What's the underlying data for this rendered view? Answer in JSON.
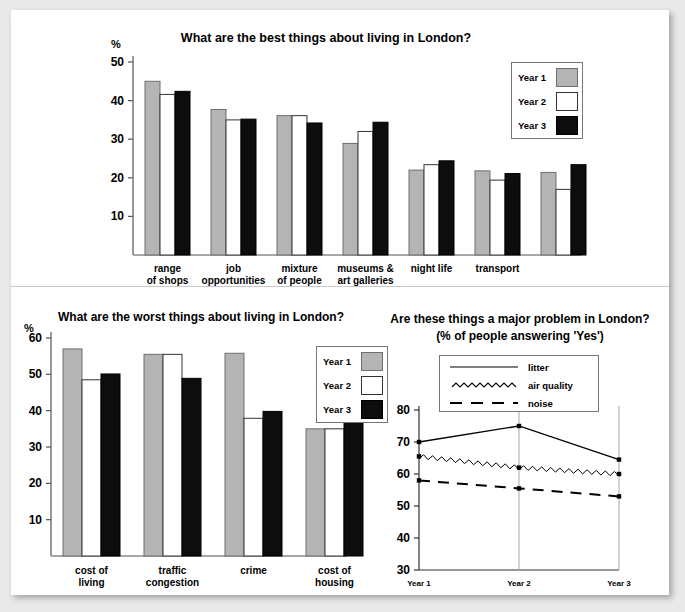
{
  "page": {
    "background": "#e9e9e9",
    "sheet_color": "#ffffff"
  },
  "colors": {
    "year1": "#b4b4b4",
    "year2": "#ffffff",
    "year3": "#0d0d0d",
    "axis": "#555555",
    "grid": "#a8a8a8"
  },
  "bar_legend": {
    "items": [
      {
        "label": "Year 1",
        "swatch": "year1"
      },
      {
        "label": "Year 2",
        "swatch": "year2"
      },
      {
        "label": "Year 3",
        "swatch": "year3"
      }
    ]
  },
  "chart_data": [
    {
      "id": "best-things",
      "type": "bar",
      "title": "What are the best things about living in London?",
      "xlabel": "",
      "ylabel": "%",
      "ylim": [
        0,
        50
      ],
      "yticks": [
        10,
        20,
        30,
        40,
        50
      ],
      "grid": false,
      "legend_position": "top-right",
      "categories": [
        "range\nof shops",
        "job\nopportunities",
        "mixture\nof people",
        "museums &\nart galleries",
        "night life",
        "transport",
        ""
      ],
      "series": [
        {
          "name": "Year 1",
          "values": [
            45,
            37.7,
            36.1,
            28.9,
            22,
            21.8,
            21.4
          ]
        },
        {
          "name": "Year 2",
          "values": [
            41.6,
            35,
            36.1,
            32,
            23.4,
            19.4,
            17
          ]
        },
        {
          "name": "Year 3",
          "values": [
            42.4,
            35.2,
            34.2,
            34.4,
            24.4,
            21.1,
            23.4
          ]
        }
      ]
    },
    {
      "id": "worst-things",
      "type": "bar",
      "title": "What are the worst things about living in London?",
      "xlabel": "",
      "ylabel": "%",
      "ylim": [
        0,
        60
      ],
      "yticks": [
        10,
        20,
        30,
        40,
        50,
        60
      ],
      "grid": false,
      "legend_position": "top-right",
      "categories": [
        "cost of\nliving",
        "traffic\ncongestion",
        "crime",
        "cost of\nhousing",
        "transport"
      ],
      "series": [
        {
          "name": "Year 1",
          "values": [
            57,
            55.5,
            55.8,
            35,
            35.1
          ]
        },
        {
          "name": "Year 2",
          "values": [
            48.5,
            55.5,
            37.9,
            35,
            26.7
          ]
        },
        {
          "name": "Year 3",
          "values": [
            50.1,
            48.9,
            39.8,
            36.5,
            26.7
          ]
        }
      ]
    },
    {
      "id": "major-problem",
      "type": "line",
      "title": "Are these things a major problem in London?",
      "subtitle": "(% of people answering 'Yes')",
      "xlabel": "",
      "ylabel": "",
      "ylim": [
        30,
        80
      ],
      "yticks": [
        30,
        40,
        50,
        60,
        70,
        80
      ],
      "grid": true,
      "legend_position": "top-right",
      "x": [
        "Year 1",
        "Year 2",
        "Year 3"
      ],
      "series": [
        {
          "name": "litter",
          "style": "solid",
          "values": [
            70,
            75,
            64.5
          ]
        },
        {
          "name": "air quality",
          "style": "zigzag",
          "values": [
            65.5,
            62,
            60
          ]
        },
        {
          "name": "noise",
          "style": "dashed",
          "values": [
            58,
            55.5,
            53
          ]
        }
      ]
    }
  ]
}
